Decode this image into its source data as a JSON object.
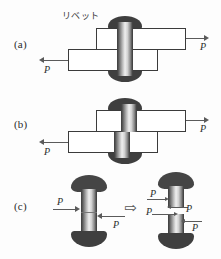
{
  "figure": {
    "caption_jp_rivet": "リベット",
    "panels": [
      {
        "id": "a",
        "label": "(a)",
        "force_labels": [
          "P",
          "P"
        ]
      },
      {
        "id": "b",
        "label": "(b)",
        "force_labels": [
          "P",
          "P"
        ]
      },
      {
        "id": "c",
        "label": "(c)",
        "force_labels": [
          "P",
          "P",
          "P",
          "P",
          "P",
          "P"
        ]
      }
    ],
    "symbols": {
      "implies": "⇨"
    },
    "colors": {
      "rivet_head": "#3f3f3f",
      "plate_outline": "#3b3b3b",
      "plate_fill": "#ffffff",
      "arrow": "#5a5a5a",
      "text": "#2b2b2b",
      "background": "#fdfdfd"
    },
    "labels": {
      "panel_a": "(a)",
      "panel_b": "(b)",
      "panel_c": "(c)",
      "rivet_jp": "リベット",
      "force_p": "P",
      "implies": "⇨"
    }
  }
}
